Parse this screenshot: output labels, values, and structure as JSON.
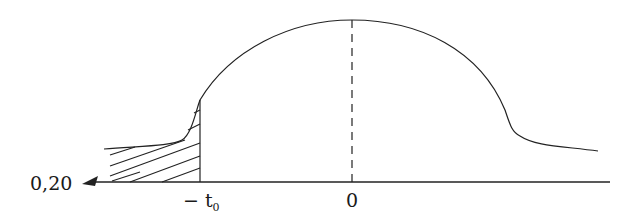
{
  "diagram": {
    "type": "pulse-profile",
    "labels": {
      "origin_value": "0,20",
      "neg_t0_prefix": "− t",
      "neg_t0_sub": "0",
      "zero": "0"
    },
    "colors": {
      "stroke": "#222222",
      "background": "#ffffff"
    },
    "elements": [
      "horizontal-axis",
      "arrow-left",
      "bell-curve",
      "dashed-center-line",
      "hatched-region-before-minus-t0"
    ]
  }
}
